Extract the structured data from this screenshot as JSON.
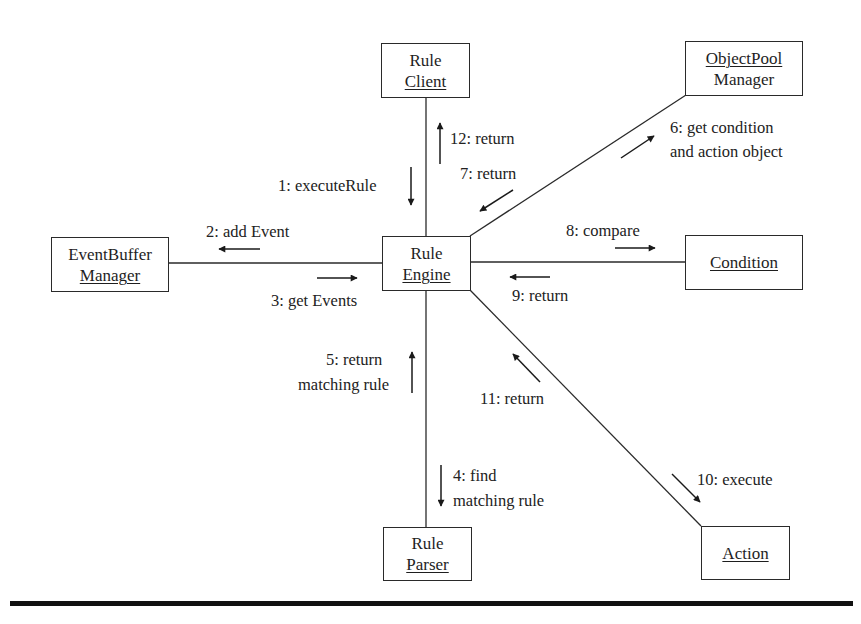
{
  "diagram": {
    "type": "UML collaboration diagram",
    "objects": {
      "rule_client": {
        "line1": "Rule",
        "line2": "Client",
        "underlined": "line2"
      },
      "objectpool_manager": {
        "line1": "ObjectPool",
        "line2": "Manager",
        "underlined": "line1"
      },
      "eventbuffer_manager": {
        "line1": "EventBuffer",
        "line2": "Manager",
        "underlined": "line2"
      },
      "rule_engine": {
        "line1": "Rule",
        "line2": "Engine",
        "underlined": "line2"
      },
      "condition": {
        "line1": "Condition",
        "underlined": "line1"
      },
      "rule_parser": {
        "line1": "Rule",
        "line2": "Parser",
        "underlined": "line2"
      },
      "action": {
        "line1": "Action",
        "underlined": "line1"
      }
    },
    "messages": {
      "m1": "1: executeRule",
      "m2": "2: add Event",
      "m3": "3: get Events",
      "m4_line1": "4: find",
      "m4_line2": "matching rule",
      "m5_line1": "5: return",
      "m5_line2": "matching rule",
      "m6_line1": "6: get condition",
      "m6_line2": "and action object",
      "m7": "7: return",
      "m8": "8: compare",
      "m9": "9: return",
      "m10": "10: execute",
      "m11": "11: return",
      "m12": "12: return"
    },
    "links": [
      {
        "from": "Rule Client",
        "to": "Rule Engine"
      },
      {
        "from": "ObjectPool Manager",
        "to": "Rule Engine"
      },
      {
        "from": "EventBuffer Manager",
        "to": "Rule Engine"
      },
      {
        "from": "Rule Engine",
        "to": "Condition"
      },
      {
        "from": "Rule Engine",
        "to": "Rule Parser"
      },
      {
        "from": "Rule Engine",
        "to": "Action"
      }
    ],
    "colors": {
      "ink": "#1e1e1e",
      "background": "#ffffff"
    }
  }
}
